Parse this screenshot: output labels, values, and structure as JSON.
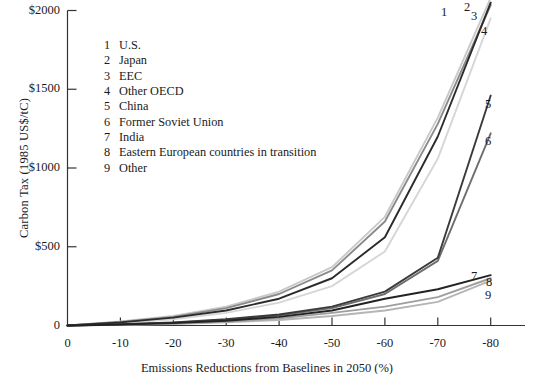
{
  "chart_data": {
    "type": "line",
    "title": "",
    "xlabel": "Emissions Reductions from Baselines in 2050 (%)",
    "ylabel": "Carbon Tax (1985 US$/tC)",
    "xlim": [
      0,
      -87
    ],
    "ylim": [
      0,
      2060
    ],
    "grid": false,
    "legend_position": "upper-left-inset",
    "x_ticks": [
      "0",
      "-10",
      "-20",
      "-30",
      "-40",
      "-50",
      "-60",
      "-70",
      "-80"
    ],
    "x_tick_values": [
      0,
      -10,
      -20,
      -30,
      -40,
      -50,
      -60,
      -70,
      -80
    ],
    "y_ticks": [
      "0",
      "$500",
      "$1000",
      "$1500",
      "$2000"
    ],
    "y_tick_values": [
      0,
      500,
      1000,
      1500,
      2000
    ],
    "x": [
      0,
      -10,
      -20,
      -30,
      -40,
      -50,
      -60,
      -70,
      -80
    ],
    "series": [
      {
        "name": "U.S.",
        "key": "1",
        "color": "#2b2b2b",
        "label": "1",
        "values": [
          0,
          20,
          50,
          95,
          170,
          300,
          560,
          1200,
          2050
        ]
      },
      {
        "name": "Japan",
        "key": "2",
        "color": "#c9c9c9",
        "label": "2",
        "values": [
          0,
          25,
          60,
          120,
          215,
          370,
          690,
          1320,
          2080
        ]
      },
      {
        "name": "EEC",
        "key": "3",
        "color": "#8a8a8a",
        "label": "3",
        "values": [
          0,
          22,
          55,
          110,
          200,
          350,
          660,
          1280,
          2035
        ]
      },
      {
        "name": "Other OECD",
        "key": "4",
        "color": "#d6d6d6",
        "label": "4",
        "values": [
          0,
          15,
          40,
          80,
          145,
          250,
          470,
          1060,
          1950
        ]
      },
      {
        "name": "China",
        "key": "5",
        "color": "#3a3a3a",
        "label": "5",
        "values": [
          0,
          8,
          20,
          40,
          70,
          120,
          215,
          430,
          1460
        ]
      },
      {
        "name": "Former Soviet Union",
        "key": "6",
        "color": "#6e6e6e",
        "label": "6",
        "values": [
          0,
          7,
          18,
          36,
          64,
          110,
          200,
          410,
          1220
        ]
      },
      {
        "name": "India",
        "key": "7",
        "color": "#232323",
        "label": "7",
        "values": [
          0,
          6,
          15,
          30,
          55,
          95,
          170,
          230,
          320
        ]
      },
      {
        "name": "Eastern European countries in transition",
        "key": "8",
        "color": "#9e9e9e",
        "label": "8",
        "values": [
          0,
          5,
          12,
          25,
          45,
          80,
          120,
          180,
          300
        ]
      },
      {
        "name": "Other",
        "key": "9",
        "color": "#b5b5b5",
        "label": "9",
        "values": [
          0,
          4,
          10,
          20,
          35,
          60,
          95,
          150,
          285
        ]
      }
    ],
    "legend": [
      {
        "num": "1",
        "name": "U.S."
      },
      {
        "num": "2",
        "name": "Japan"
      },
      {
        "num": "3",
        "name": "EEC"
      },
      {
        "num": "4",
        "name": "Other OECD"
      },
      {
        "num": "5",
        "name": "China"
      },
      {
        "num": "6",
        "name": "Former Soviet Union"
      },
      {
        "num": "7",
        "name": "India"
      },
      {
        "num": "8",
        "name": "Eastern European countries in transition"
      },
      {
        "num": "9",
        "name": "Other"
      }
    ],
    "curve_end_labels": [
      {
        "label": "1",
        "x": 441,
        "y": 5
      },
      {
        "label": "2",
        "x": 464,
        "y": 0
      },
      {
        "label": "3",
        "x": 471,
        "y": 9
      },
      {
        "label": "4",
        "x": 481,
        "y": 24
      },
      {
        "label": "5",
        "x": 485,
        "y": 97
      },
      {
        "label": "6",
        "x": 485,
        "y": 134
      },
      {
        "label": "7",
        "x": 471,
        "y": 269
      },
      {
        "label": "8",
        "x": 486,
        "y": 275
      },
      {
        "label": "9",
        "x": 485,
        "y": 288
      }
    ]
  },
  "axes": {
    "y_title": "Carbon Tax (1985 US$/tC)",
    "x_title": "Emissions Reductions from Baselines in 2050 (%)"
  }
}
